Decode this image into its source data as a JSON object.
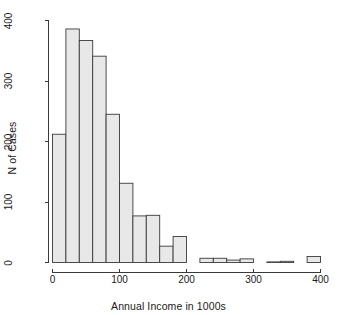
{
  "chart_data": {
    "type": "bar",
    "title": "",
    "xlabel": "Annual Income in 1000s",
    "ylabel": "N of Cases",
    "xlim": [
      0,
      400
    ],
    "ylim": [
      0,
      400
    ],
    "xticks": [
      0,
      100,
      200,
      300,
      400
    ],
    "yticks": [
      0,
      100,
      200,
      300,
      400
    ],
    "xtick_labels": [
      "0",
      "100",
      "200",
      "300",
      "400"
    ],
    "ytick_labels": [
      "0",
      "100",
      "200",
      "300",
      "400"
    ],
    "grid": false,
    "legend": "none",
    "bin_width": 20,
    "bin_edges": [
      0,
      20,
      40,
      60,
      80,
      100,
      120,
      140,
      160,
      180,
      200,
      220,
      240,
      260,
      280,
      300,
      320,
      340,
      360,
      380,
      400
    ],
    "categories": [
      "0-20",
      "20-40",
      "40-60",
      "60-80",
      "80-100",
      "100-120",
      "120-140",
      "140-160",
      "160-180",
      "180-200",
      "200-220",
      "220-240",
      "240-260",
      "260-280",
      "280-300",
      "300-320",
      "320-340",
      "340-360",
      "360-380",
      "380-400"
    ],
    "values": [
      212,
      386,
      367,
      341,
      245,
      131,
      77,
      78,
      27,
      43,
      0,
      7,
      7,
      4,
      6,
      0,
      1,
      2,
      0,
      10
    ],
    "bar_fill": "#e8e8e8",
    "bar_stroke": "#3a3a3a",
    "axis_color": "#3a3a3a"
  },
  "axes": {
    "x_title": "Annual Income in 1000s",
    "y_title": "N of Cases"
  }
}
